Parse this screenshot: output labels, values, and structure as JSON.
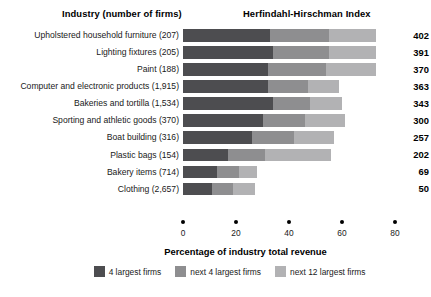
{
  "header": {
    "industry_title": "Industry (number of firms)",
    "hhi_title": "Herfindahl-Hirschman Index"
  },
  "axis": {
    "xlabel": "Percentage of industry total revenue",
    "ticks": [
      "0",
      "20",
      "40",
      "60",
      "80"
    ]
  },
  "legend": {
    "items": [
      {
        "label": "4 largest firms",
        "color": "#4d4d50"
      },
      {
        "label": "next 4 largest firms",
        "color": "#8e8e90"
      },
      {
        "label": "next 12 largest firms",
        "color": "#b2b2b4"
      }
    ]
  },
  "rows": [
    {
      "label": "Upholstered household furniture  (207)",
      "value": "402"
    },
    {
      "label": "Lighting fixtures  (205)",
      "value": "391"
    },
    {
      "label": "Paint  (188)",
      "value": "370"
    },
    {
      "label": "Computer and electronic products  (1,915)",
      "value": "363"
    },
    {
      "label": "Bakeries and tortilla  (1,534)",
      "value": "343"
    },
    {
      "label": "Sporting and athletic goods  (370)",
      "value": "300"
    },
    {
      "label": "Boat building (316)",
      "value": "257"
    },
    {
      "label": "Plastic bags  (154)",
      "value": "202"
    },
    {
      "label": "Bakery items (714)",
      "value": "69"
    },
    {
      "label": "Clothing  (2,657)",
      "value": "50"
    }
  ],
  "chart_data": {
    "type": "bar",
    "orientation": "horizontal",
    "stacked": true,
    "title": "",
    "xlabel": "Percentage of industry total revenue",
    "ylabel": "Industry (number of firms)",
    "xlim": [
      0,
      80
    ],
    "xticks": [
      0,
      20,
      40,
      60,
      80
    ],
    "grid": false,
    "legend_position": "bottom",
    "categories": [
      "Upholstered household furniture  (207)",
      "Lighting fixtures  (205)",
      "Paint  (188)",
      "Computer and electronic products  (1,915)",
      "Bakeries and tortilla  (1,534)",
      "Sporting and athletic goods  (370)",
      "Boat building (316)",
      "Plastic bags  (154)",
      "Bakery items (714)",
      "Clothing  (2,657)"
    ],
    "series": [
      {
        "name": "4 largest firms",
        "color": "#4d4d50",
        "values": [
          33,
          34,
          32,
          32,
          34,
          30,
          26,
          17,
          13,
          11
        ]
      },
      {
        "name": "next 4 largest firms",
        "color": "#8e8e90",
        "values": [
          22,
          21,
          22,
          15,
          14,
          16,
          16,
          14,
          8,
          8
        ]
      },
      {
        "name": "next 12 largest firms",
        "color": "#b2b2b4",
        "values": [
          18,
          18,
          19,
          12,
          12,
          15,
          15,
          25,
          7,
          8
        ]
      }
    ],
    "annotations": {
      "secondary_axis_title": "Herfindahl-Hirschman Index",
      "secondary_values": [
        402,
        391,
        370,
        363,
        343,
        300,
        257,
        202,
        69,
        50
      ]
    }
  }
}
